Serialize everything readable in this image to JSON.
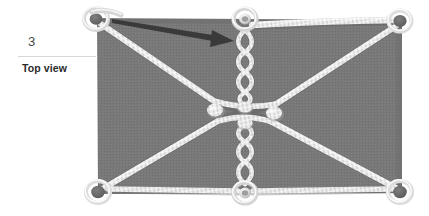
{
  "figure": {
    "step_number": "3",
    "caption": "Top view",
    "type": "instructional-diagram"
  },
  "colors": {
    "background": "#ffffff",
    "tarp_fill": "#787878",
    "tarp_shade": "#6e6e6e",
    "rope_light": "#ececec",
    "rope_mid": "#c9c9c9",
    "rope_shadow": "#9a9a9a",
    "grommet_dark": "#6a6a6a",
    "grommet_ring": "#e4e4e4",
    "arrow": "#3a3a3a",
    "rule": "#d7d7d7",
    "step_text": "#4a4a4a",
    "caption_text": "#2b2b2b"
  },
  "tarp": {
    "left": 97,
    "top": 18,
    "right": 402,
    "bottom": 194,
    "label": "tarp-panel"
  },
  "grommets": [
    {
      "name": "grommet-top-left",
      "x": 96,
      "y": 19,
      "style": "ring"
    },
    {
      "name": "grommet-top-center",
      "x": 245,
      "y": 19,
      "style": "ring"
    },
    {
      "name": "grommet-top-right",
      "x": 400,
      "y": 20,
      "style": "dark"
    },
    {
      "name": "grommet-bottom-left",
      "x": 98,
      "y": 193,
      "style": "dark"
    },
    {
      "name": "grommet-bottom-center",
      "x": 245,
      "y": 194,
      "style": "ring"
    },
    {
      "name": "grommet-bottom-right",
      "x": 400,
      "y": 193,
      "style": "dark"
    }
  ],
  "ropes": [
    {
      "name": "rope-diagonal-topleft-to-center",
      "from": "grommet-top-left",
      "to": "knot-center-left"
    },
    {
      "name": "rope-diagonal-bottomleft-to-center",
      "from": "grommet-bottom-left",
      "to": "knot-center-left"
    },
    {
      "name": "rope-diagonal-topright-to-center",
      "from": "grommet-top-right",
      "to": "knot-center-right"
    },
    {
      "name": "rope-diagonal-bottomright-to-center",
      "from": "grommet-bottom-right",
      "to": "knot-center-right"
    },
    {
      "name": "rope-twist-top",
      "from": "grommet-top-center",
      "to": "knot-upper-center",
      "style": "twisted"
    },
    {
      "name": "rope-twist-bottom",
      "from": "grommet-bottom-center",
      "to": "knot-lower-center",
      "style": "twisted"
    },
    {
      "name": "rope-top-edge-right",
      "from": "grommet-top-center",
      "to": "grommet-top-right",
      "style": "edge"
    }
  ],
  "arrow": {
    "name": "direction-arrow",
    "from_x": 112,
    "from_y": 20,
    "to_x": 232,
    "to_y": 41,
    "description": "lacing direction"
  }
}
